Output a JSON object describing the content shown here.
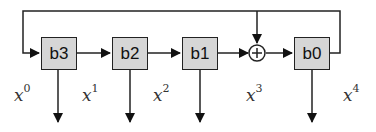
{
  "diagram": {
    "type": "shift-register / LFSR",
    "registers": [
      {
        "id": "b3",
        "label": "b3",
        "x": 41
      },
      {
        "id": "b2",
        "label": "b2",
        "x": 112
      },
      {
        "id": "b1",
        "label": "b1",
        "x": 182
      },
      {
        "id": "b0",
        "label": "b0",
        "x": 294
      }
    ],
    "xor_symbol": "+",
    "terms": [
      {
        "base": "x",
        "exp": "0",
        "x": 14,
        "y": 82
      },
      {
        "base": "x",
        "exp": "1",
        "x": 82,
        "y": 86
      },
      {
        "base": "x",
        "exp": "2",
        "x": 153,
        "y": 86
      },
      {
        "base": "x",
        "exp": "3",
        "x": 246,
        "y": 86
      },
      {
        "base": "x",
        "exp": "4",
        "x": 343,
        "y": 86
      }
    ],
    "colors": {
      "box_fill": "#d6d6d6",
      "stroke": "#222222"
    }
  }
}
